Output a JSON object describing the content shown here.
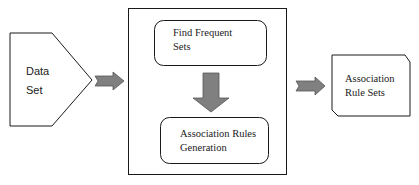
{
  "diagram": {
    "type": "flowchart",
    "colors": {
      "stroke": "#1a1a1a",
      "arrow_fill": "#808080",
      "background": "#ffffff"
    },
    "nodes": {
      "data_set": {
        "line1": "Data",
        "line2": "Set",
        "shape": "pentagon-arrow"
      },
      "process_container": {
        "shape": "rectangle"
      },
      "find_frequent_sets": {
        "line1": "Find Frequent",
        "line2": "Sets",
        "shape": "rounded-rectangle"
      },
      "association_rules_generation": {
        "line1": "Association Rules",
        "line2": "Generation",
        "shape": "rounded-rectangle"
      },
      "association_rule_sets": {
        "line1": "Association",
        "line2": "Rule Sets",
        "shape": "snipped-corner-rectangle"
      }
    },
    "edges": [
      {
        "from": "data_set",
        "to": "process_container",
        "style": "block-arrow-right"
      },
      {
        "from": "find_frequent_sets",
        "to": "association_rules_generation",
        "style": "block-arrow-down"
      },
      {
        "from": "process_container",
        "to": "association_rule_sets",
        "style": "block-arrow-right"
      }
    ]
  }
}
